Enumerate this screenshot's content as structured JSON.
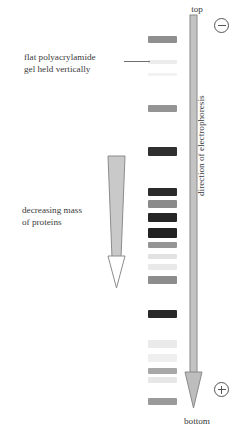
{
  "figure": {
    "labels": {
      "gel": "flat polyacrylamide\ngel held vertically",
      "mass": "decreasing mass\nof proteins",
      "top": "top",
      "bottom": "bottom",
      "direction": "direction of electrophoresis"
    },
    "charges": {
      "top_electrode": "−",
      "bottom_electrode": "+"
    },
    "colors": {
      "background": "#ffffff",
      "text": "#3a3a3a",
      "band_dark": "#2e2e2e",
      "band_mid": "#9a9a9a",
      "band_faint": "#ececec",
      "wedge_fill": "#c9c9c9",
      "wedge_stroke": "#8c8c8c",
      "arrow_fill": "#bdbdbd",
      "arrow_stroke": "#8a8a8a",
      "leader_line": "#6f6f6f"
    }
  },
  "chart_data": {
    "type": "bar",
    "xlabel": "",
    "ylabel": "migration distance (top → bottom)",
    "axis_note": "Vertical lane; y = distance from top of gel in pixels; darkness = band intensity (0 faint – 1 dark)",
    "lane_x": 148,
    "lane_width": 29,
    "categories": [
      "band-1",
      "band-2",
      "band-3",
      "band-4",
      "band-5",
      "band-6",
      "band-7",
      "band-8",
      "band-9",
      "band-10",
      "band-11",
      "band-12",
      "band-13",
      "band-14",
      "band-15",
      "band-16",
      "band-17",
      "band-18"
    ],
    "bands": [
      {
        "name": "band-1",
        "y": 36,
        "height": 7,
        "intensity": 0.52,
        "color": "#8f8f8f"
      },
      {
        "name": "band-2",
        "y": 60,
        "height": 4,
        "intensity": 0.08,
        "color": "#ededed"
      },
      {
        "name": "band-3",
        "y": 73,
        "height": 3,
        "intensity": 0.04,
        "color": "#f2f2f2"
      },
      {
        "name": "band-4",
        "y": 105,
        "height": 7,
        "intensity": 0.5,
        "color": "#949494"
      },
      {
        "name": "band-5",
        "y": 147,
        "height": 9,
        "intensity": 0.88,
        "color": "#2f2f2f"
      },
      {
        "name": "band-6",
        "y": 188,
        "height": 8,
        "intensity": 0.9,
        "color": "#2b2b2b"
      },
      {
        "name": "band-7",
        "y": 200,
        "height": 8,
        "intensity": 0.55,
        "color": "#8a8a8a"
      },
      {
        "name": "band-8",
        "y": 213,
        "height": 9,
        "intensity": 0.93,
        "color": "#262626"
      },
      {
        "name": "band-9",
        "y": 228,
        "height": 10,
        "intensity": 0.95,
        "color": "#222222"
      },
      {
        "name": "band-10",
        "y": 242,
        "height": 6,
        "intensity": 0.5,
        "color": "#959595"
      },
      {
        "name": "band-11",
        "y": 254,
        "height": 5,
        "intensity": 0.14,
        "color": "#e2e2e2"
      },
      {
        "name": "band-12",
        "y": 264,
        "height": 6,
        "intensity": 0.1,
        "color": "#e9e9e9"
      },
      {
        "name": "band-13",
        "y": 276,
        "height": 8,
        "intensity": 0.55,
        "color": "#8d8d8d"
      },
      {
        "name": "band-14",
        "y": 310,
        "height": 8,
        "intensity": 0.92,
        "color": "#282828"
      },
      {
        "name": "band-15",
        "y": 340,
        "height": 8,
        "intensity": 0.1,
        "color": "#eaeaea"
      },
      {
        "name": "band-16",
        "y": 354,
        "height": 8,
        "intensity": 0.07,
        "color": "#efefef"
      },
      {
        "name": "band-17",
        "y": 368,
        "height": 6,
        "intensity": 0.4,
        "color": "#a8a8a8"
      },
      {
        "name": "band-18",
        "y": 377,
        "height": 6,
        "intensity": 0.12,
        "color": "#e7e7e7"
      },
      {
        "name": "band-19",
        "y": 398,
        "height": 7,
        "intensity": 0.48,
        "color": "#9a9a9a"
      }
    ],
    "annotations": [
      {
        "name": "decreasing-mass-wedge",
        "text": "decreasing mass of proteins",
        "x": 104,
        "y": 155,
        "w": 36,
        "h": 135
      },
      {
        "name": "electrophoresis-arrow",
        "text": "direction of electrophoresis",
        "x": 179,
        "y": 14,
        "w": 34,
        "h": 400
      },
      {
        "name": "gel-leader-line",
        "text": "flat polyacrylamide gel held vertically",
        "x": 124,
        "y": 61
      }
    ],
    "legend_position": "none",
    "grid": false
  }
}
